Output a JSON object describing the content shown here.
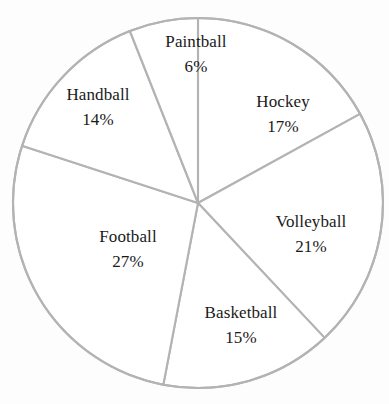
{
  "chart_data": {
    "type": "pie",
    "title": "",
    "subtitle": "",
    "xlabel": "",
    "ylabel": "",
    "legend_position": "none",
    "grid": false,
    "value_unit": "%",
    "total": 100,
    "start_angle_deg": 0,
    "direction": "clockwise",
    "categories": [
      "Hockey",
      "Volleyball",
      "Basketball",
      "Football",
      "Handball",
      "Paintball"
    ],
    "values": [
      17,
      21,
      15,
      27,
      14,
      6
    ],
    "slices": [
      {
        "key": "hockey",
        "label": "Hockey",
        "value": 17,
        "value_text": "17%",
        "start_deg": 0,
        "end_deg": 61.2,
        "fill": "#ffffff",
        "stroke": "#b3b3b3"
      },
      {
        "key": "volleyball",
        "label": "Volleyball",
        "value": 21,
        "value_text": "21%",
        "start_deg": 61.2,
        "end_deg": 136.8,
        "fill": "#ffffff",
        "stroke": "#b3b3b3"
      },
      {
        "key": "basketball",
        "label": "Basketball",
        "value": 15,
        "value_text": "15%",
        "start_deg": 136.8,
        "end_deg": 190.8,
        "fill": "#ffffff",
        "stroke": "#b3b3b3"
      },
      {
        "key": "football",
        "label": "Football",
        "value": 27,
        "value_text": "27%",
        "start_deg": 190.8,
        "end_deg": 288.0,
        "fill": "#ffffff",
        "stroke": "#b3b3b3"
      },
      {
        "key": "handball",
        "label": "Handball",
        "value": 14,
        "value_text": "14%",
        "start_deg": 288.0,
        "end_deg": 338.4,
        "fill": "#ffffff",
        "stroke": "#b3b3b3"
      },
      {
        "key": "paintball",
        "label": "Paintball",
        "value": 6,
        "value_text": "6%",
        "start_deg": 338.4,
        "end_deg": 360.0,
        "fill": "#ffffff",
        "stroke": "#b3b3b3"
      }
    ],
    "geometry": {
      "center_x": 198,
      "center_y": 203,
      "radius": 185
    },
    "colors": {
      "background": "#fdfdfd",
      "slice_fill": "#ffffff",
      "slice_stroke": "#b3b3b3",
      "text": "#1a1a1a"
    }
  }
}
